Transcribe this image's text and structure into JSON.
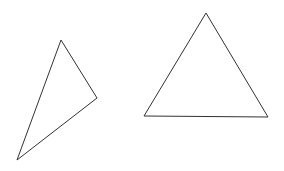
{
  "canvas": {
    "width": 284,
    "height": 171,
    "background": "#ffffff"
  },
  "shapes": [
    {
      "name": "scalene-triangle",
      "points": [
        [
          61,
          40
        ],
        [
          97,
          98
        ],
        [
          17,
          160
        ]
      ],
      "stroke": "#333333",
      "fill": "none"
    },
    {
      "name": "equilateral-triangle",
      "points": [
        [
          206,
          13
        ],
        [
          268,
          117
        ],
        [
          144,
          116
        ]
      ],
      "stroke": "#333333",
      "fill": "none"
    }
  ]
}
